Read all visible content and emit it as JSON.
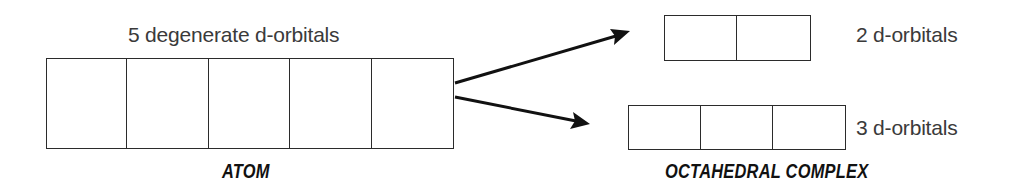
{
  "diagram": {
    "atom": {
      "top_label": "5 degenerate d-orbitals",
      "caption": "ATOM",
      "orbital_count": 5
    },
    "complex": {
      "caption": "OCTAHEDRAL COMPLEX",
      "upper_set": {
        "label": "2 d-orbitals",
        "orbital_count": 2
      },
      "lower_set": {
        "label": "3 d-orbitals",
        "orbital_count": 3
      }
    },
    "arrows": [
      {
        "from": "atom",
        "to": "upper_set"
      },
      {
        "from": "atom",
        "to": "lower_set"
      }
    ],
    "colors": {
      "line": "#2b2b2b",
      "label_text": "#3a3a3a",
      "caption_text": "#111111",
      "background": "#ffffff"
    }
  }
}
